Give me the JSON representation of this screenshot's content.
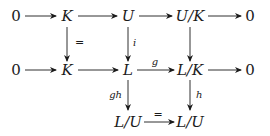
{
  "diagram": {
    "type": "commutative-diagram",
    "nodes": {
      "r1c1": "0",
      "r1c2": "K",
      "r1c3": "U",
      "r1c4": "U/K",
      "r1c5": "0",
      "r2c1": "0",
      "r2c2": "K",
      "r2c3": "L",
      "r2c4": "L/K",
      "r2c5": "0",
      "r3c3": "L/U",
      "r3c4": "L/U"
    },
    "edge_labels": {
      "k_eq": "=",
      "i": "i",
      "g": "g",
      "gh": "gh",
      "h": "h",
      "lu_eq": "="
    }
  }
}
